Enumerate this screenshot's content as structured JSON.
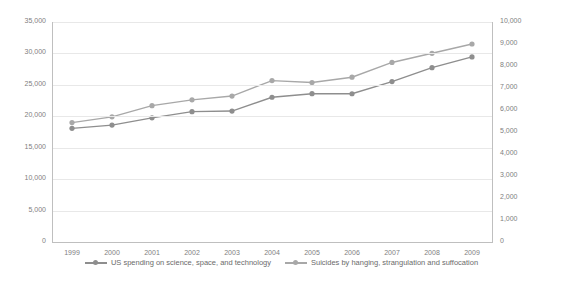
{
  "chart_data": {
    "type": "line",
    "title": "",
    "xlabel": "",
    "ylabel": "",
    "grid": true,
    "legend_position": "bottom",
    "categories": [
      "1999",
      "2000",
      "2001",
      "2002",
      "2003",
      "2004",
      "2005",
      "2006",
      "2007",
      "2008",
      "2009"
    ],
    "axes": {
      "left": {
        "ticks": [
          "0",
          "5,000",
          "10,000",
          "15,000",
          "20,000",
          "25,000",
          "30,000",
          "35,000"
        ],
        "min": 0,
        "max": 35000
      },
      "right": {
        "ticks": [
          "0",
          "1,000",
          "2,000",
          "3,000",
          "4,000",
          "5,000",
          "6,000",
          "7,000",
          "8,000",
          "9,000",
          "10,000"
        ],
        "min": 0,
        "max": 10000
      }
    },
    "series": [
      {
        "name": "US spending on science, space, and technology",
        "axis": "left",
        "color": "#8e8e8e",
        "values": [
          18079,
          18594,
          19753,
          20734,
          20831,
          23029,
          23597,
          23584,
          25525,
          27731,
          29449
        ]
      },
      {
        "name": "Suicides by hanging, strangulation and suffocation",
        "axis": "right",
        "color": "#a8a8a8",
        "values": [
          5427,
          5688,
          6198,
          6462,
          6635,
          7336,
          7248,
          7491,
          8161,
          8578,
          9000
        ]
      }
    ],
    "legend": [
      "US spending on science, space, and technology",
      "Suicides by hanging, strangulation and suffocation"
    ]
  }
}
